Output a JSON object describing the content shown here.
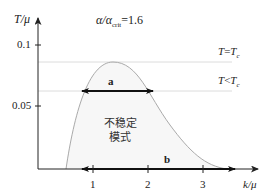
{
  "diagram": {
    "title_parts": {
      "lhs": "α/α",
      "sub": "crit",
      "rhs": "=1.6"
    },
    "y_axis": {
      "label_main": "T/μ",
      "ticks": [
        {
          "value": "0.1",
          "y": 45
        },
        {
          "value": "0.05",
          "y": 106
        }
      ]
    },
    "x_axis": {
      "label_main": "k/μ",
      "ticks": [
        {
          "value": "1",
          "x": 93
        },
        {
          "value": "2",
          "x": 148
        },
        {
          "value": "3",
          "x": 203
        }
      ]
    },
    "lines": [
      {
        "id": "t-eq-tc",
        "label_lhs": "T",
        "label_op": "=",
        "label_rhs": "T",
        "label_sub": "c",
        "y": 62
      },
      {
        "id": "t-lt-tc",
        "label_lhs": "T",
        "label_op": "<",
        "label_rhs": "T",
        "label_sub": "c",
        "y": 91
      }
    ],
    "region_label_line1": "不稳定",
    "region_label_line2": "模式",
    "arrow_a_label": "a",
    "arrow_b_label": "b",
    "colors": {
      "axis": "#222222",
      "curve": "#aaaaaa",
      "fill": "#f7f7f7",
      "hline": "#dddddd",
      "arrow": "#111111"
    }
  }
}
